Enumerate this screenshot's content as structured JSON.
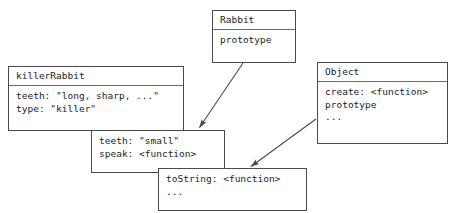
{
  "diagram": {
    "background_color": "#ffffff",
    "line_color": "#4a4a4a",
    "text_color": "#1c1c1c",
    "boxes": [
      {
        "id": "rabbit",
        "title": "Rabbit",
        "properties": [
          "prototype"
        ]
      },
      {
        "id": "killerRabbit",
        "title": "killerRabbit",
        "properties": [
          "teeth: \"long, sharp, ...\"",
          "type: \"killer\""
        ]
      },
      {
        "id": "rabbitPrototype",
        "title": "",
        "properties": [
          "teeth: \"small\"",
          "speak: <function>"
        ]
      },
      {
        "id": "objectPrototype",
        "title": "",
        "properties": [
          "toString: <function>",
          "..."
        ]
      },
      {
        "id": "object",
        "title": "Object",
        "properties": [
          "create: <function>",
          "prototype",
          "..."
        ]
      }
    ],
    "arrows": [
      {
        "id": "rabbit-to-rabbit-prototype",
        "from": "rabbit",
        "to": "rabbitPrototype"
      },
      {
        "id": "object-to-object-prototype",
        "from": "object",
        "to": "objectPrototype"
      }
    ]
  }
}
